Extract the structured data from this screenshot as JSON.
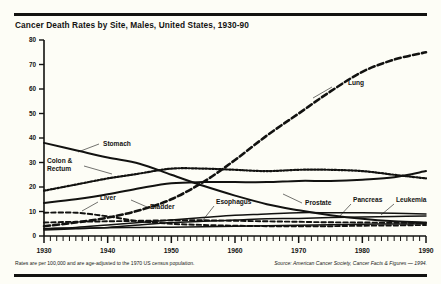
{
  "chart_title": "Cancer Death Rates by Site, Males, United States, 1930-90",
  "note_left": "Rates are per 100,000 and are age-adjusted to the 1970 US census population.",
  "note_right": "Source: American Cancer Society, Cancer Facts & Figures — 1994.",
  "labels": {
    "lung": "Lung",
    "stomach": "Stomach",
    "colon_rectum_1": "Colon &",
    "colon_rectum_2": "Rectum",
    "liver": "Liver",
    "bladder": "Bladder",
    "esophagus": "Esophagus",
    "prostate": "Prostate",
    "pancreas": "Pancreas",
    "leukemia": "Leukemia"
  },
  "colors": {
    "ink": "#121210",
    "paper": "#fdfdf6"
  },
  "chart_data": {
    "type": "line",
    "title": "Cancer Death Rates by Site, Males, United States, 1930-90",
    "subtitle": "Rates are per 100,000 and are age-adjusted to the 1970 US census population.",
    "source": "American Cancer Society, Cancer Facts & Figures — 1994.",
    "xlabel": "",
    "ylabel": "",
    "xlim": [
      1930,
      1990
    ],
    "ylim": [
      0,
      80
    ],
    "yticks": [
      0,
      10,
      20,
      30,
      40,
      50,
      60,
      70,
      80
    ],
    "xticks": [
      1930,
      1940,
      1950,
      1960,
      1970,
      1980,
      1990
    ],
    "x_minor_tick_interval": 1,
    "grid": false,
    "legend": "inline-annotations",
    "x": [
      1930,
      1935,
      1940,
      1945,
      1950,
      1955,
      1960,
      1965,
      1970,
      1975,
      1980,
      1985,
      1990
    ],
    "series": [
      {
        "name": "Lung",
        "style": "dashed-heavy",
        "values": [
          4.0,
          5.5,
          7.5,
          10.5,
          15.0,
          22.0,
          31.0,
          41.0,
          50.0,
          59.0,
          67.0,
          72.0,
          75.0
        ]
      },
      {
        "name": "Stomach",
        "style": "solid",
        "values": [
          38.0,
          35.0,
          32.0,
          29.5,
          25.0,
          20.5,
          16.5,
          13.0,
          10.5,
          8.5,
          7.0,
          6.0,
          5.5
        ]
      },
      {
        "name": "Colon & Rectum",
        "style": "dotted",
        "values": [
          18.5,
          21.0,
          23.5,
          25.5,
          27.5,
          27.5,
          27.0,
          26.5,
          27.0,
          27.0,
          26.5,
          25.0,
          23.5
        ]
      },
      {
        "name": "Prostate",
        "style": "solid",
        "values": [
          13.5,
          15.0,
          17.0,
          19.5,
          21.5,
          22.0,
          22.0,
          22.0,
          22.5,
          22.5,
          23.0,
          24.0,
          26.5
        ]
      },
      {
        "name": "Liver",
        "style": "dashed-fine",
        "values": [
          9.5,
          9.5,
          8.0,
          6.0,
          5.0,
          4.5,
          4.2,
          4.0,
          4.0,
          4.0,
          4.2,
          4.3,
          4.5
        ]
      },
      {
        "name": "Bladder",
        "style": "dashed-fine",
        "values": [
          5.5,
          5.8,
          6.0,
          6.2,
          6.4,
          6.4,
          6.2,
          6.0,
          5.8,
          5.6,
          5.5,
          5.4,
          5.3
        ]
      },
      {
        "name": "Esophagus",
        "style": "solid-thin",
        "values": [
          3.0,
          3.2,
          3.4,
          3.5,
          3.6,
          3.8,
          4.0,
          4.2,
          4.4,
          4.6,
          4.8,
          4.9,
          5.0
        ]
      },
      {
        "name": "Pancreas",
        "style": "solid-thin",
        "values": [
          3.0,
          3.5,
          4.5,
          5.5,
          6.5,
          7.5,
          8.5,
          9.0,
          9.5,
          9.5,
          9.5,
          9.3,
          9.0
        ]
      },
      {
        "name": "Leukemia",
        "style": "solid-thin",
        "values": [
          2.5,
          3.0,
          3.5,
          4.5,
          5.5,
          6.0,
          6.5,
          7.0,
          7.2,
          7.5,
          7.8,
          8.0,
          8.2
        ]
      }
    ]
  }
}
